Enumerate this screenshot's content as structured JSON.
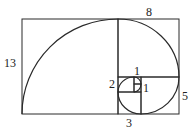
{
  "diagram": {
    "stroke_color": "#2a2a2a",
    "background": "#ffffff",
    "squares": [
      {
        "size": 13,
        "x": 22,
        "y": 19,
        "w": 96,
        "h": 95
      },
      {
        "size": 8,
        "x": 118,
        "y": 19,
        "w": 61,
        "h": 58
      },
      {
        "size": 5,
        "x": 141,
        "y": 77,
        "w": 38,
        "h": 37
      },
      {
        "size": 3,
        "x": 118,
        "y": 92,
        "w": 23,
        "h": 22
      },
      {
        "size": 2,
        "x": 118,
        "y": 77,
        "w": 16,
        "h": 15
      },
      {
        "size": 1,
        "x": 134,
        "y": 77,
        "w": 7,
        "h": 7
      },
      {
        "size": 1,
        "x": 134,
        "y": 84,
        "w": 7,
        "h": 8
      }
    ],
    "labels": [
      {
        "text": "13",
        "x": 4,
        "y": 67
      },
      {
        "text": "8",
        "x": 146,
        "y": 16
      },
      {
        "text": "5",
        "x": 182,
        "y": 100
      },
      {
        "text": "3",
        "x": 126,
        "y": 127
      },
      {
        "text": "2",
        "x": 109,
        "y": 88
      },
      {
        "text": "1",
        "x": 134,
        "y": 75
      },
      {
        "text": "1",
        "x": 143,
        "y": 92
      }
    ]
  }
}
